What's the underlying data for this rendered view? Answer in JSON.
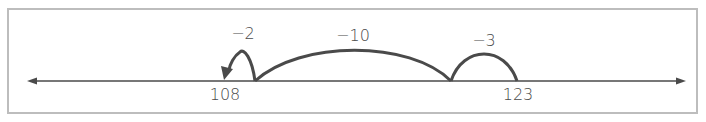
{
  "diagram": {
    "type": "number-line",
    "title": "",
    "colors": {
      "line": "#4a4a4a",
      "border": "#bdbdbd",
      "text": "#4a4a4a",
      "background": "#ffffff"
    },
    "marked_points": [
      {
        "value": "108",
        "x": 224
      },
      {
        "value": "123",
        "x": 517
      }
    ],
    "jumps": [
      {
        "label": "−3",
        "from": "123",
        "to": "120"
      },
      {
        "label": "−10",
        "from": "120",
        "to": "110"
      },
      {
        "label": "−2",
        "from": "110",
        "to": "108"
      }
    ]
  }
}
